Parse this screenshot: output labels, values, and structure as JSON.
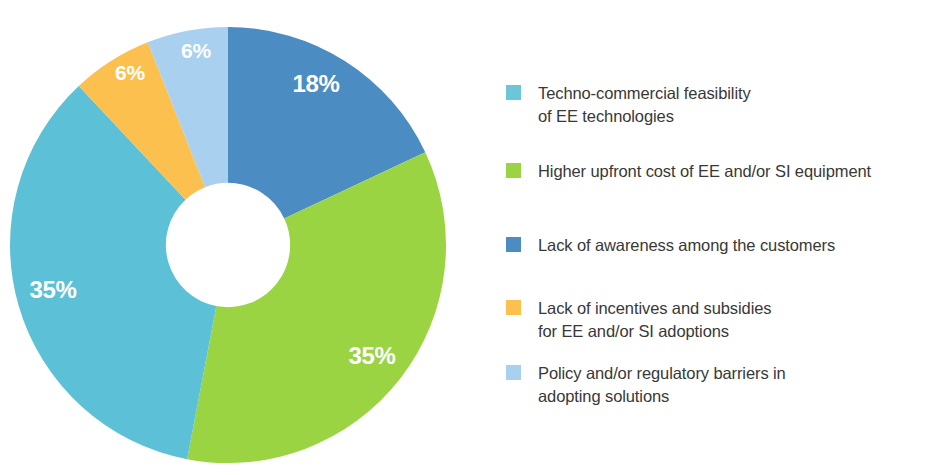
{
  "chart_data": {
    "type": "pie",
    "variant": "donut",
    "title": "",
    "subtitle": "",
    "xlabel": "",
    "ylabel": "",
    "grid": false,
    "legend_position": "right",
    "units": "percent",
    "hole_ratio": 0.285,
    "start_angle_deg": 0,
    "direction": "clockwise",
    "categories": [
      "Lack of awareness among the customers",
      "Higher upfront cost of EE and/or SI equipment",
      "Techno-commercial feasibility of EE technologies",
      "Lack of incentives and subsidies for EE and/or SI adoptions",
      "Policy and/or regulatory barriers in adopting solutions"
    ],
    "values": [
      18,
      35,
      35,
      6,
      6
    ],
    "value_labels": [
      "18%",
      "35%",
      "35%",
      "6%",
      "6%"
    ],
    "colors": [
      "#4b8cc2",
      "#9ad443",
      "#5cc1d6",
      "#fac košt"
    ],
    "slices": [
      {
        "name": "Lack of awareness among the customers",
        "value": 18,
        "label": "18%",
        "color": "#4b8cc2",
        "start_deg": 0,
        "end_deg": 64.8,
        "label_x": 316,
        "label_y": 86
      },
      {
        "name": "Higher upfront cost of EE and/or SI equipment",
        "value": 35,
        "label": "35%",
        "color": "#9ad443",
        "start_deg": 64.8,
        "end_deg": 190.8,
        "label_x": 372,
        "label_y": 358
      },
      {
        "name": "Techno-commercial feasibility of EE technologies",
        "value": 35,
        "label": "35%",
        "color": "#5cc1d6",
        "start_deg": 190.8,
        "end_deg": 316.8,
        "label_x": 53,
        "label_y": 292
      },
      {
        "name": "Lack of incentives and subsidies for EE and/or SI adoptions",
        "value": 6,
        "label": "6%",
        "color": "#fbc04e",
        "start_deg": 316.8,
        "end_deg": 338.4,
        "label_x": 130,
        "label_y": 74
      },
      {
        "name": "Policy and/or regulatory barriers in adopting solutions",
        "value": 6,
        "label": "6%",
        "color": "#a9d0ee",
        "start_deg": 338.4,
        "end_deg": 360,
        "label_x": 196,
        "label_y": 52
      }
    ],
    "legend": [
      {
        "label": "Techno-commercial feasibility\nof EE technologies",
        "color": "#6cc6da",
        "value": 35
      },
      {
        "label": "Higher upfront cost of EE and/or SI equipment",
        "color": "#9ad443",
        "value": 35
      },
      {
        "label": "Lack of awareness among the customers",
        "color": "#4b8cc2",
        "value": 18
      },
      {
        "label": "Lack of incentives and subsidies\nfor EE and/or SI adoptions",
        "color": "#fbc04e",
        "value": 6
      },
      {
        "label": "Policy and/or regulatory barriers in\nadopting solutions",
        "color": "#a9d0ee",
        "value": 6
      }
    ]
  },
  "legend_layout": {
    "tops": [
      0,
      78,
      152,
      215,
      280
    ]
  }
}
